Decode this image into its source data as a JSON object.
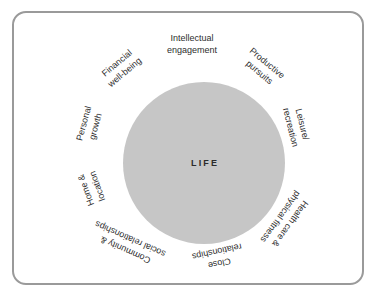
{
  "figure": {
    "center_label": "LIFE",
    "frame_color": "#9a9a9a",
    "circle_color": "#c6c6c6",
    "text_color": "#2e2e2e"
  },
  "domains": [
    {
      "id": "intellectual-engagement",
      "line1": "Intellectual",
      "line2": "engagement",
      "angle_deg": 0,
      "rotation_deg": 0,
      "radius": 108
    },
    {
      "id": "productive-pursuits",
      "line1": "Productive",
      "line2": "pursuits",
      "angle_deg": 40,
      "rotation_deg": 40,
      "radius": 110
    },
    {
      "id": "leisure-recreation",
      "line1": "Leisure/",
      "line2": "recreation",
      "angle_deg": 76,
      "rotation_deg": 76,
      "radius": 107
    },
    {
      "id": "health-care-physical-fitness",
      "line1": "Health care &",
      "line2": "physical fitness",
      "angle_deg": 126,
      "rotation_deg": 126,
      "radius": 115
    },
    {
      "id": "close-relationships",
      "line1": "Close",
      "line2": "relationships",
      "angle_deg": 166,
      "rotation_deg": 168,
      "radius": 108
    },
    {
      "id": "community-social-relationships",
      "line1": "Community &",
      "line2": "social relationships",
      "angle_deg": 215,
      "rotation_deg": 204,
      "radius": 112
    },
    {
      "id": "home-location",
      "line1": "Home &",
      "line2": "location",
      "angle_deg": 250,
      "rotation_deg": 250,
      "radius": 106
    },
    {
      "id": "personal-growth",
      "line1": "Personal",
      "line2": "growth",
      "angle_deg": 285,
      "rotation_deg": 285,
      "radius": 106
    },
    {
      "id": "financial-well-being",
      "line1": "Financial",
      "line2": "well-being",
      "angle_deg": 320,
      "rotation_deg": 320,
      "radius": 110
    }
  ]
}
